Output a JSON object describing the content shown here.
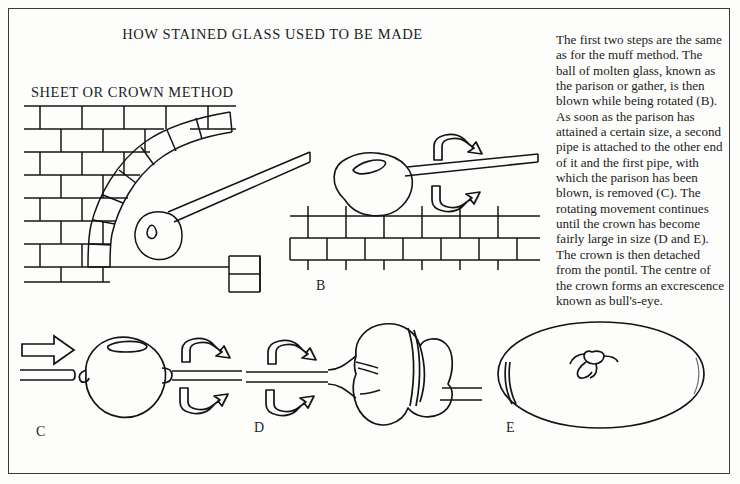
{
  "page": {
    "title": "HOW STAINED GLASS USED TO BE MADE",
    "section_heading": "SHEET OR CROWN METHOD",
    "background_color": "#fdfdfc",
    "ink_color": "#141414",
    "border_color": "#3a3a3a"
  },
  "sidebar": {
    "body_text": "The first two steps are the same as for the muff method. The ball of molten glass, known as the parison or gather, is then blown while being rotated (B). As soon as the parison has attained a certain size, a second pipe is attached to the other end of it and the first pipe, with which the parison has been blown, is removed (C). The rotating movement continues until the crown has become fairly large in size (D and E). The crown is then detached from the pontil. The centre of the crown forms an excrescence known as bull's-eye."
  },
  "panels": [
    {
      "id": "A",
      "label": "",
      "caption": "Furnace with arched brick opening; gather of molten glass on the end of the blowing pipe",
      "elements": [
        "brick-wall",
        "arch-voussoirs",
        "blowing-pipe",
        "molten-gather",
        "furnace-floor",
        "floor-block"
      ]
    },
    {
      "id": "B",
      "label": "B",
      "caption": "Parison blown while being rotated on the marver",
      "elements": [
        "parison",
        "blowing-pipe",
        "rotation-arrow-up",
        "rotation-arrow-down",
        "brick-courses"
      ]
    },
    {
      "id": "C",
      "label": "C",
      "caption": "Second pipe attached, first blowing pipe removed",
      "elements": [
        "removed-pipe",
        "direction-arrow",
        "expanded-parison",
        "pontil",
        "rotation-arrow-up",
        "rotation-arrow-down"
      ]
    },
    {
      "id": "D",
      "label": "D",
      "caption": "Rotating movement continues until the crown becomes fairly large",
      "elements": [
        "pipe",
        "rotation-arrow-up",
        "rotation-arrow-down",
        "flattening-crown",
        "pontil-rod"
      ]
    },
    {
      "id": "E",
      "label": "E",
      "caption": "Finished crown disc with central bull's-eye",
      "elements": [
        "crown-disc",
        "bulls-eye",
        "edge-crease"
      ]
    }
  ]
}
